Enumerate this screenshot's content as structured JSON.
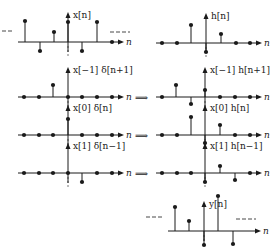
{
  "diagram": {
    "axis_variable": "n",
    "implies_symbol": "⟹",
    "left_column": [
      {
        "id": "x",
        "label": "x[n]",
        "origin": 68,
        "axis_y": 42,
        "samples": [
          {
            "x": 25,
            "y": 21
          },
          {
            "x": 40,
            "y": 51
          },
          {
            "x": 54,
            "y": 32
          },
          {
            "x": 68,
            "y": 22
          },
          {
            "x": 82,
            "y": 51
          },
          {
            "x": 97,
            "y": 22
          },
          {
            "x": 112,
            "y": 42
          }
        ],
        "dashes_left": true,
        "dashes_right": true
      },
      {
        "id": "xm1",
        "label": "x[−1] δ[n+1]",
        "origin": 68,
        "axis_y": 97,
        "samples": [
          {
            "x": 24,
            "y": 97
          },
          {
            "x": 39,
            "y": 97
          },
          {
            "x": 53,
            "y": 85
          },
          {
            "x": 68,
            "y": 97
          },
          {
            "x": 82,
            "y": 97
          },
          {
            "x": 97,
            "y": 97
          },
          {
            "x": 112,
            "y": 97
          }
        ]
      },
      {
        "id": "x0",
        "label": "x[0] δ[n]",
        "origin": 68,
        "axis_y": 135,
        "samples": [
          {
            "x": 24,
            "y": 135
          },
          {
            "x": 39,
            "y": 135
          },
          {
            "x": 53,
            "y": 135
          },
          {
            "x": 68,
            "y": 119
          },
          {
            "x": 82,
            "y": 135
          },
          {
            "x": 97,
            "y": 135
          },
          {
            "x": 112,
            "y": 135
          }
        ]
      },
      {
        "id": "x1",
        "label": "x[1] δ[n−1]",
        "origin": 68,
        "axis_y": 173,
        "samples": [
          {
            "x": 24,
            "y": 173
          },
          {
            "x": 39,
            "y": 173
          },
          {
            "x": 53,
            "y": 173
          },
          {
            "x": 68,
            "y": 173
          },
          {
            "x": 82,
            "y": 182
          },
          {
            "x": 97,
            "y": 173
          },
          {
            "x": 112,
            "y": 173
          }
        ]
      }
    ],
    "right_column": [
      {
        "id": "h",
        "label": "h[n]",
        "origin": 206,
        "axis_y": 43,
        "samples": [
          {
            "x": 162,
            "y": 43
          },
          {
            "x": 177,
            "y": 43
          },
          {
            "x": 191,
            "y": 25
          },
          {
            "x": 206,
            "y": 52
          },
          {
            "x": 221,
            "y": 34
          },
          {
            "x": 236,
            "y": 43
          },
          {
            "x": 250,
            "y": 43
          }
        ]
      },
      {
        "id": "hm1",
        "label": "x[−1] h[n+1]",
        "origin": 205,
        "axis_y": 97,
        "samples": [
          {
            "x": 162,
            "y": 97
          },
          {
            "x": 176,
            "y": 85
          },
          {
            "x": 191,
            "y": 104
          },
          {
            "x": 205,
            "y": 90
          },
          {
            "x": 220,
            "y": 97
          },
          {
            "x": 235,
            "y": 97
          },
          {
            "x": 250,
            "y": 97
          }
        ]
      },
      {
        "id": "h0",
        "label": "x[0] h[n]",
        "origin": 205,
        "axis_y": 135,
        "samples": [
          {
            "x": 162,
            "y": 135
          },
          {
            "x": 177,
            "y": 135
          },
          {
            "x": 191,
            "y": 117
          },
          {
            "x": 205,
            "y": 143
          },
          {
            "x": 220,
            "y": 125
          },
          {
            "x": 235,
            "y": 135
          },
          {
            "x": 250,
            "y": 135
          }
        ]
      },
      {
        "id": "h1",
        "label": "x[1] h[n−1]",
        "origin": 205,
        "axis_y": 173,
        "samples": [
          {
            "x": 162,
            "y": 173
          },
          {
            "x": 177,
            "y": 173
          },
          {
            "x": 191,
            "y": 173
          },
          {
            "x": 205,
            "y": 182
          },
          {
            "x": 220,
            "y": 166
          },
          {
            "x": 235,
            "y": 180
          },
          {
            "x": 250,
            "y": 173
          }
        ]
      },
      {
        "id": "y",
        "label": "y[n]",
        "origin": 204,
        "axis_y": 231,
        "samples": [
          {
            "x": 175,
            "y": 207
          },
          {
            "x": 189,
            "y": 221
          },
          {
            "x": 204,
            "y": 245
          },
          {
            "x": 218,
            "y": 196
          },
          {
            "x": 233,
            "y": 244
          }
        ],
        "dashes_left": true,
        "dashes_right": true
      }
    ],
    "arrows_y": [
      97,
      135,
      173
    ]
  }
}
